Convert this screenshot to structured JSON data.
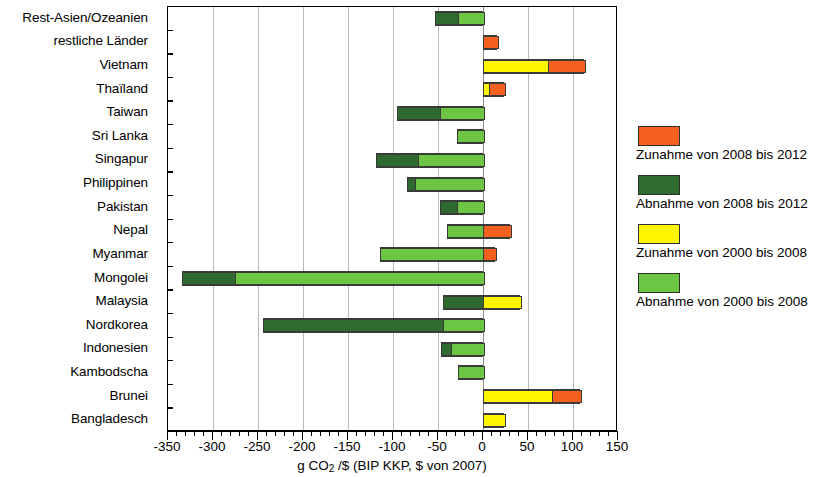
{
  "chart_data": {
    "type": "bar",
    "orientation": "horizontal",
    "stacked": true,
    "title": "",
    "xlabel": "g CO2 /$  (BIP KKP, $ von 2007)",
    "ylabel": "",
    "xlim": [
      -350,
      150
    ],
    "xticks": [
      -350,
      -300,
      -250,
      -200,
      -150,
      -100,
      -50,
      0,
      50,
      100,
      150
    ],
    "xtick_labels": [
      "-350",
      "-300",
      "-250",
      "-200",
      "-150",
      "-100",
      "-50",
      "0",
      "50",
      "100",
      "150"
    ],
    "minor_tick_step": 10,
    "grid": true,
    "grid_axis": "x",
    "legend_position": "right",
    "categories": [
      "Rest-Asien/Ozeanien",
      "restliche Länder",
      "Vietnam",
      "Thaïland",
      "Taiwan",
      "Sri Lanka",
      "Singapur",
      "Philippinen",
      "Pakistan",
      "Nepal",
      "Myanmar",
      "Mongolei",
      "Malaysia",
      "Nordkorea",
      "Indonesien",
      "Kambodscha",
      "Brunei",
      "Bangladesch"
    ],
    "series": [
      {
        "name": "Zunahme von 2008 bis 2012",
        "color": "#F4601E",
        "values": [
          0,
          16,
          40,
          16,
          0,
          0,
          0,
          0,
          0,
          30,
          13,
          0,
          0,
          0,
          0,
          0,
          31,
          0
        ]
      },
      {
        "name": "Abnahme von 2008 bis 2012",
        "color": "#2F6B2F",
        "values": [
          -25,
          0,
          0,
          0,
          -48,
          0,
          -47,
          -8,
          -19,
          0,
          0,
          -58,
          -44,
          -200,
          -11,
          0,
          0,
          0
        ]
      },
      {
        "name": "Zunahme von 2000 bis 2008",
        "color": "#FFF500",
        "values": [
          0,
          0,
          72,
          7,
          0,
          0,
          0,
          0,
          0,
          0,
          0,
          0,
          41,
          0,
          0,
          0,
          77,
          23
        ]
      },
      {
        "name": "Abnahme von 2000 bis 2008",
        "color": "#6CC644",
        "values": [
          -28,
          0,
          0,
          0,
          -48,
          -29,
          -72,
          -76,
          -29,
          -40,
          -114,
          -276,
          0,
          -44,
          -36,
          -28,
          0,
          0
        ]
      }
    ],
    "bars": [
      {
        "category": "Rest-Asien/Ozeanien",
        "segments": [
          {
            "series": "Abnahme von 2008 bis 2012",
            "from": -53,
            "to": -28
          },
          {
            "series": "Abnahme von 2000 bis 2008",
            "from": -28,
            "to": 0
          }
        ]
      },
      {
        "category": "restliche Länder",
        "segments": [
          {
            "series": "Zunahme von 2008 bis 2012",
            "from": 0,
            "to": 16
          }
        ]
      },
      {
        "category": "Vietnam",
        "segments": [
          {
            "series": "Zunahme von 2000 bis 2008",
            "from": 0,
            "to": 72
          },
          {
            "series": "Zunahme von 2008 bis 2012",
            "from": 72,
            "to": 112
          }
        ]
      },
      {
        "category": "Thaïland",
        "segments": [
          {
            "series": "Zunahme von 2000 bis 2008",
            "from": 0,
            "to": 7
          },
          {
            "series": "Zunahme von 2008 bis 2012",
            "from": 7,
            "to": 23
          }
        ]
      },
      {
        "category": "Taiwan",
        "segments": [
          {
            "series": "Abnahme von 2008 bis 2012",
            "from": -96,
            "to": -48
          },
          {
            "series": "Abnahme von 2000 bis 2008",
            "from": -48,
            "to": 0
          }
        ]
      },
      {
        "category": "Sri Lanka",
        "segments": [
          {
            "series": "Abnahme von 2000 bis 2008",
            "from": -29,
            "to": 0
          }
        ]
      },
      {
        "category": "Singapur",
        "segments": [
          {
            "series": "Abnahme von 2008 bis 2012",
            "from": -119,
            "to": -72
          },
          {
            "series": "Abnahme von 2000 bis 2008",
            "from": -72,
            "to": 0
          }
        ]
      },
      {
        "category": "Philippinen",
        "segments": [
          {
            "series": "Abnahme von 2008 bis 2012",
            "from": -84,
            "to": -76
          },
          {
            "series": "Abnahme von 2000 bis 2008",
            "from": -76,
            "to": 0
          }
        ]
      },
      {
        "category": "Pakistan",
        "segments": [
          {
            "series": "Abnahme von 2008 bis 2012",
            "from": -48,
            "to": -29
          },
          {
            "series": "Abnahme von 2000 bis 2008",
            "from": -29,
            "to": 0
          }
        ]
      },
      {
        "category": "Nepal",
        "segments": [
          {
            "series": "Abnahme von 2000 bis 2008",
            "from": -40,
            "to": 0
          },
          {
            "series": "Zunahme von 2008 bis 2012",
            "from": 0,
            "to": 30
          }
        ]
      },
      {
        "category": "Myanmar",
        "segments": [
          {
            "series": "Abnahme von 2000 bis 2008",
            "from": -114,
            "to": 0
          },
          {
            "series": "Zunahme von 2008 bis 2012",
            "from": 0,
            "to": 13
          }
        ]
      },
      {
        "category": "Mongolei",
        "segments": [
          {
            "series": "Abnahme von 2008 bis 2012",
            "from": -334,
            "to": -276
          },
          {
            "series": "Abnahme von 2000 bis 2008",
            "from": -276,
            "to": 0
          }
        ]
      },
      {
        "category": "Malaysia",
        "segments": [
          {
            "series": "Abnahme von 2008 bis 2012",
            "from": -44,
            "to": 0
          },
          {
            "series": "Zunahme von 2000 bis 2008",
            "from": 0,
            "to": 41
          }
        ]
      },
      {
        "category": "Nordkorea",
        "segments": [
          {
            "series": "Abnahme von 2008 bis 2012",
            "from": -244,
            "to": -44
          },
          {
            "series": "Abnahme von 2000 bis 2008",
            "from": -44,
            "to": 0
          }
        ]
      },
      {
        "category": "Indonesien",
        "segments": [
          {
            "series": "Abnahme von 2008 bis 2012",
            "from": -47,
            "to": -36
          },
          {
            "series": "Abnahme von 2000 bis 2008",
            "from": -36,
            "to": 0
          }
        ]
      },
      {
        "category": "Kambodscha",
        "segments": [
          {
            "series": "Abnahme von 2000 bis 2008",
            "from": -28,
            "to": 0
          }
        ]
      },
      {
        "category": "Brunei",
        "segments": [
          {
            "series": "Zunahme von 2000 bis 2008",
            "from": 0,
            "to": 77
          },
          {
            "series": "Zunahme von 2008 bis 2012",
            "from": 77,
            "to": 108
          }
        ]
      },
      {
        "category": "Bangladesch",
        "segments": [
          {
            "series": "Zunahme von 2000 bis 2008",
            "from": 0,
            "to": 23
          }
        ]
      }
    ]
  },
  "legend": {
    "entries": [
      {
        "label": "Zunahme von 2008 bis 2012",
        "color": "#F4601E"
      },
      {
        "label": "Abnahme von 2008 bis 2012",
        "color": "#2F6B2F"
      },
      {
        "label": "Zunahme von 2000 bis 2008",
        "color": "#FFF500"
      },
      {
        "label": "Abnahme von 2000 bis 2008",
        "color": "#6CC644"
      }
    ]
  },
  "axis_title": {
    "prefix": "g CO",
    "sub": "2",
    "suffix": " /$  (BIP KKP, $ von 2007)"
  }
}
